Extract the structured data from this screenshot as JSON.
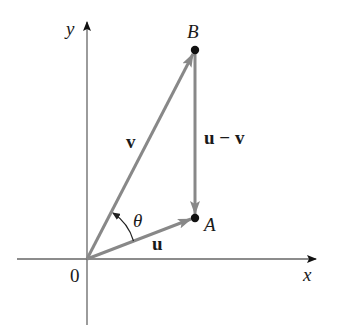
{
  "diagram": {
    "type": "vector-subtraction",
    "axes": {
      "x_label": "x",
      "y_label": "y",
      "origin_label": "0"
    },
    "points": {
      "A": {
        "label": "A"
      },
      "B": {
        "label": "B"
      }
    },
    "vectors": [
      {
        "id": "u",
        "label": "u",
        "from": "0",
        "to": "A"
      },
      {
        "id": "v",
        "label": "v",
        "from": "0",
        "to": "B"
      },
      {
        "id": "u_minus_v",
        "label": "u − v",
        "from": "B",
        "to": "A"
      }
    ],
    "angle": {
      "label": "θ",
      "between": [
        "u",
        "v"
      ]
    },
    "colors": {
      "axis": "#555555",
      "vector": "#888888",
      "point": "#111111",
      "text": "#1a1a1a"
    }
  }
}
